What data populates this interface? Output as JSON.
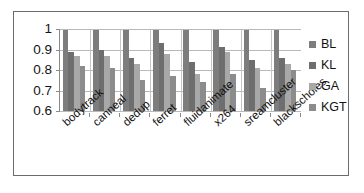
{
  "chart_data": {
    "type": "bar",
    "title": "",
    "xlabel": "",
    "ylabel": "",
    "ylim": [
      0.6,
      1.0
    ],
    "yticks": [
      "0.6",
      "0.7",
      "0.8",
      "0.9",
      "1"
    ],
    "grid": true,
    "legend_position": "right",
    "categories": [
      "bodytrack",
      "canneal",
      "dedup",
      "ferret",
      "fluidanimate",
      "x264",
      "sreamcluster",
      "blackscholes"
    ],
    "series": [
      {
        "name": "BL",
        "color": "#7d7d7d",
        "values": [
          1.0,
          1.0,
          1.0,
          1.0,
          1.0,
          1.0,
          1.0,
          1.0
        ]
      },
      {
        "name": "KL",
        "color": "#6e6e6e",
        "values": [
          0.89,
          0.9,
          0.86,
          0.93,
          0.84,
          0.91,
          0.85,
          0.86
        ]
      },
      {
        "name": "GA",
        "color": "#a8a8a8",
        "values": [
          0.87,
          0.87,
          0.83,
          0.88,
          0.78,
          0.89,
          0.81,
          0.83
        ]
      },
      {
        "name": "KGT",
        "color": "#8c8c8c",
        "values": [
          0.82,
          0.81,
          0.75,
          0.77,
          0.74,
          0.78,
          0.71,
          0.8
        ]
      }
    ]
  },
  "legend": {
    "items": [
      {
        "label": "BL"
      },
      {
        "label": "KL"
      },
      {
        "label": "GA"
      },
      {
        "label": "KGT"
      }
    ]
  }
}
